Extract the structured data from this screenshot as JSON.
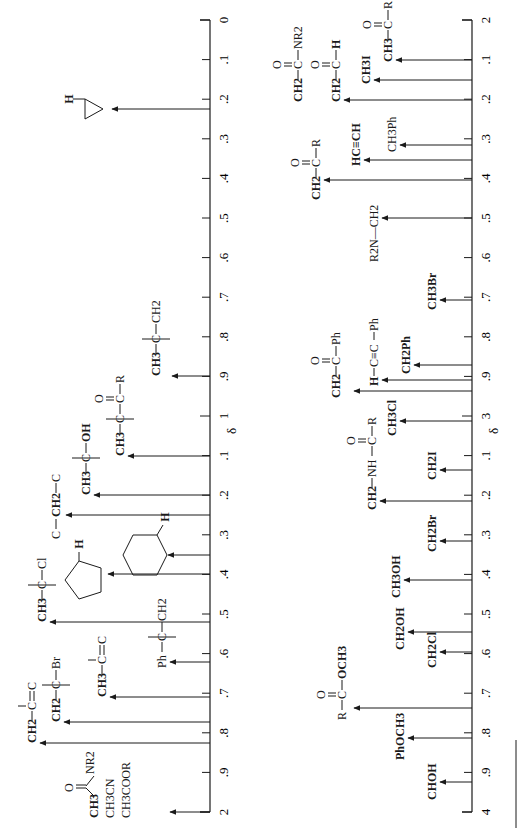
{
  "chart_data": [
    {
      "type": "scatter",
      "title": "Proton NMR chemical shift correlation chart (δ 0–2)",
      "orientation": "rotated 90° clockwise; δ axis runs top→bottom",
      "xlabel": "δ",
      "axis_range": [
        0,
        2
      ],
      "tick_labels": [
        "0",
        ".1",
        ".2",
        ".3",
        ".4",
        ".5",
        ".6",
        ".7",
        ".8",
        ".9",
        "1",
        ".1",
        ".2",
        ".3",
        ".4",
        ".5",
        ".6",
        ".7",
        ".8",
        ".9",
        "2"
      ],
      "peaks": [
        {
          "label": "cyclopropane C–H",
          "delta": 0.22
        },
        {
          "label": "CH3–C–CH2 (alkyl)",
          "delta": 0.9
        },
        {
          "label": "CH3–C–C(=O)–R",
          "delta": 1.1
        },
        {
          "label": "CH3–C–OH",
          "delta": 1.2
        },
        {
          "label": "C–CH2–C",
          "delta": 1.25
        },
        {
          "label": "cyclohexane C–H",
          "delta": 1.35
        },
        {
          "label": "cyclopentane C–H",
          "delta": 1.4
        },
        {
          "label": "CH3–C–Cl",
          "delta": 1.52
        },
        {
          "label": "Ph–C–CH2",
          "delta": 1.62
        },
        {
          "label": "CH3–C=C",
          "delta": 1.7
        },
        {
          "label": "CH2–C–Br",
          "delta": 1.75
        },
        {
          "label": "CH2–C=C",
          "delta": 1.8
        },
        {
          "label": "CH3C(=O)NR2 / CH3CN / CH3COOR",
          "delta": 2.0
        }
      ]
    },
    {
      "type": "scatter",
      "title": "Proton NMR chemical shift correlation chart (δ 2–4)",
      "orientation": "rotated 90° clockwise; δ axis runs top→bottom",
      "xlabel": "δ",
      "axis_range": [
        2,
        4
      ],
      "tick_labels": [
        "2",
        ".1",
        ".2",
        ".3",
        ".4",
        ".5",
        ".6",
        ".7",
        ".8",
        ".9",
        "3",
        ".1",
        ".2",
        ".3",
        ".4",
        ".5",
        ".6",
        ".7",
        ".8",
        ".9",
        "4"
      ],
      "peaks": [
        {
          "label": "CH3–C(=O)–R",
          "delta": 2.1
        },
        {
          "label": "CH3I",
          "delta": 2.16
        },
        {
          "label": "CH2–C(=O)–H / CH2–C(=O)–NR2",
          "delta": 2.2
        },
        {
          "label": "CH3Ph",
          "delta": 2.35
        },
        {
          "label": "HC≡CH",
          "delta": 2.38
        },
        {
          "label": "CH2–C(=O)–R",
          "delta": 2.4
        },
        {
          "label": "R2N–CH2",
          "delta": 2.5
        },
        {
          "label": "CH3Br",
          "delta": 2.7
        },
        {
          "label": "CH2Ph",
          "delta": 2.85
        },
        {
          "label": "H–C≡C–Ph",
          "delta": 2.88
        },
        {
          "label": "CH2–C(=O)–Ph",
          "delta": 2.9
        },
        {
          "label": "CH3Cl",
          "delta": 3.05
        },
        {
          "label": "CH2I",
          "delta": 3.15
        },
        {
          "label": "CH2–NH–C(=O)–R",
          "delta": 3.2
        },
        {
          "label": "CH2Br",
          "delta": 3.3
        },
        {
          "label": "CH3OH",
          "delta": 3.4
        },
        {
          "label": "CH2OH",
          "delta": 3.55
        },
        {
          "label": "CH2Cl",
          "delta": 3.6
        },
        {
          "label": "R–C(=O)–OCH3",
          "delta": 3.7
        },
        {
          "label": "PhOCH3",
          "delta": 3.8
        },
        {
          "label": "CHOH",
          "delta": 3.9
        }
      ]
    }
  ],
  "axes": {
    "left": {
      "major_start": "0",
      "major_mid": "1",
      "major_end": "2",
      "minor": [
        ".1",
        ".2",
        ".3",
        ".4",
        ".5",
        ".6",
        ".7",
        ".8",
        ".9"
      ],
      "unit": "δ"
    },
    "right": {
      "major_start": "2",
      "major_mid": "3",
      "major_end": "4",
      "minor": [
        ".1",
        ".2",
        ".3",
        ".4",
        ".5",
        ".6",
        ".7",
        ".8",
        ".9"
      ],
      "unit": "δ"
    }
  },
  "labels": {
    "delta": "δ",
    "left": {
      "cyclopropane_H": "H",
      "alkyl": [
        "CH3",
        "C",
        "CH2"
      ],
      "ketone_beta": [
        "CH3",
        "C",
        "C",
        "O",
        "R"
      ],
      "alcohol_beta": [
        "CH3",
        "C",
        "OH"
      ],
      "methylene": [
        "C",
        "CH2",
        "C"
      ],
      "cyclohexane_H": "H",
      "cyclopentane_H": "H",
      "chloride_beta": [
        "CH3",
        "C",
        "Cl"
      ],
      "benzyl_beta": [
        "Ph",
        "C",
        "CH2"
      ],
      "allyl_methyl": [
        "CH3",
        "C",
        "C"
      ],
      "bromide_beta": [
        "CH2",
        "C",
        "Br"
      ],
      "allyl_methylene": [
        "CH2",
        "C",
        "C"
      ],
      "acetyl_group": [
        "CH3",
        "O",
        "NR2",
        "CH3CN",
        "CH3COOR"
      ]
    },
    "right": {
      "methyl_ketone": [
        "O",
        "CH3",
        "C",
        "R"
      ],
      "methyl_iodide": "CH3I",
      "amide_ch2": [
        "O",
        "CH2",
        "C",
        "NR2"
      ],
      "aldehyde_ch2": [
        "O",
        "CH2",
        "C",
        "H"
      ],
      "toluene": "CH3Ph",
      "acetylene": "HC≡CH",
      "ketone_ch2": [
        "O",
        "CH2",
        "C",
        "R"
      ],
      "amine_ch2": "R2N—CH2",
      "methyl_bromide": "CH3Br",
      "benzyl": "CH2Ph",
      "phenylacetylene": [
        "H",
        "C≡C",
        "Ph"
      ],
      "phenyl_ketone_ch2": [
        "O",
        "CH2",
        "C",
        "Ph"
      ],
      "methyl_chloride": "CH3Cl",
      "methylene_iodide": "CH2I",
      "amide_nh_ch2": [
        "O",
        "CH2",
        "NH",
        "C",
        "R"
      ],
      "methylene_bromide": "CH2Br",
      "methanol": "CH3OH",
      "methylene_oh": "CH2OH",
      "methylene_chloride": "CH2Cl",
      "methyl_ester": [
        "O",
        "R",
        "C",
        "OCH3"
      ],
      "anisole": "PhOCH3",
      "carbinol": "CHOH"
    }
  },
  "colors": {
    "ink": "#1a1a1a",
    "background": "#ffffff"
  }
}
